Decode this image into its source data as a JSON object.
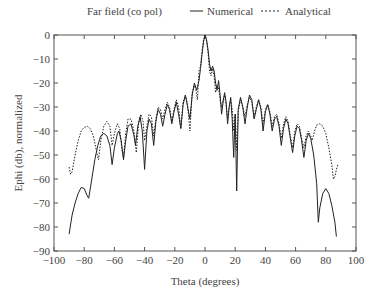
{
  "chart_data": {
    "type": "line",
    "title": "Far field (co pol)",
    "xlabel": "Theta (degrees)",
    "ylabel": "Ephi (db), normalized",
    "xlim": [
      -100,
      100
    ],
    "ylim": [
      -90,
      0
    ],
    "xticks": [
      -100,
      -80,
      -60,
      -40,
      -20,
      0,
      20,
      40,
      60,
      80,
      100
    ],
    "yticks": [
      0,
      -10,
      -20,
      -30,
      -40,
      -50,
      -60,
      -70,
      -80,
      -90
    ],
    "grid": false,
    "legend_position": "top",
    "series": [
      {
        "name": "Numerical",
        "style": "solid",
        "points": [
          [
            -90,
            -83
          ],
          [
            -88,
            -75
          ],
          [
            -86,
            -70
          ],
          [
            -84,
            -66
          ],
          [
            -82,
            -63.5
          ],
          [
            -80,
            -64
          ],
          [
            -78,
            -67
          ],
          [
            -77,
            -68
          ],
          [
            -75,
            -60
          ],
          [
            -73,
            -52
          ],
          [
            -71,
            -46
          ],
          [
            -69,
            -42
          ],
          [
            -67,
            -41
          ],
          [
            -65,
            -42
          ],
          [
            -63,
            -46
          ],
          [
            -61.5,
            -54
          ],
          [
            -60,
            -47
          ],
          [
            -58,
            -41
          ],
          [
            -57,
            -40
          ],
          [
            -55.5,
            -44
          ],
          [
            -54,
            -52
          ],
          [
            -52.5,
            -44
          ],
          [
            -51,
            -38
          ],
          [
            -49,
            -37
          ],
          [
            -47,
            -42
          ],
          [
            -46,
            -46
          ],
          [
            -44.5,
            -38
          ],
          [
            -43,
            -34
          ],
          [
            -41.5,
            -40
          ],
          [
            -40,
            -56
          ],
          [
            -38.5,
            -40
          ],
          [
            -37,
            -35
          ],
          [
            -35.5,
            -37
          ],
          [
            -34,
            -46
          ],
          [
            -32.5,
            -36
          ],
          [
            -31,
            -31
          ],
          [
            -29.5,
            -33
          ],
          [
            -28,
            -38
          ],
          [
            -26.5,
            -33
          ],
          [
            -25,
            -29
          ],
          [
            -23.5,
            -31
          ],
          [
            -22,
            -37
          ],
          [
            -20.5,
            -32
          ],
          [
            -19,
            -28
          ],
          [
            -17.5,
            -33
          ],
          [
            -16,
            -39
          ],
          [
            -14.5,
            -29
          ],
          [
            -13,
            -25
          ],
          [
            -11.5,
            -30
          ],
          [
            -10,
            -35
          ],
          [
            -8.5,
            -25
          ],
          [
            -7,
            -20
          ],
          [
            -5.5,
            -23
          ],
          [
            -4,
            -19
          ],
          [
            -3,
            -14
          ],
          [
            -2,
            -8
          ],
          [
            -1,
            -3
          ],
          [
            0,
            0
          ],
          [
            1,
            -2
          ],
          [
            2,
            -6
          ],
          [
            3,
            -12
          ],
          [
            4,
            -15
          ],
          [
            5,
            -13
          ],
          [
            6,
            -15
          ],
          [
            7,
            -20
          ],
          [
            8,
            -23
          ],
          [
            9,
            -19
          ],
          [
            10,
            -25
          ],
          [
            11,
            -33
          ],
          [
            12,
            -28
          ],
          [
            13,
            -24
          ],
          [
            14,
            -28
          ],
          [
            15,
            -37
          ],
          [
            16,
            -30
          ],
          [
            17,
            -26
          ],
          [
            18,
            -35
          ],
          [
            19,
            -51
          ],
          [
            20,
            -33
          ],
          [
            21,
            -65
          ],
          [
            22,
            -31
          ],
          [
            23.5,
            -26
          ],
          [
            25,
            -30
          ],
          [
            26.5,
            -37
          ],
          [
            28,
            -30
          ],
          [
            29.5,
            -25
          ],
          [
            31,
            -27
          ],
          [
            32.5,
            -35
          ],
          [
            34,
            -31
          ],
          [
            35.5,
            -27
          ],
          [
            37,
            -31
          ],
          [
            38.5,
            -40
          ],
          [
            40,
            -32
          ],
          [
            41.5,
            -29
          ],
          [
            43,
            -33
          ],
          [
            44.5,
            -40
          ],
          [
            46,
            -35
          ],
          [
            47.5,
            -34
          ],
          [
            49,
            -38
          ],
          [
            50.5,
            -46
          ],
          [
            52,
            -39
          ],
          [
            53.5,
            -35
          ],
          [
            55,
            -37
          ],
          [
            56.5,
            -43
          ],
          [
            58,
            -49
          ],
          [
            59.5,
            -42
          ],
          [
            61,
            -38
          ],
          [
            62.5,
            -39
          ],
          [
            64,
            -44
          ],
          [
            65.5,
            -51
          ],
          [
            67,
            -44
          ],
          [
            68.5,
            -41
          ],
          [
            70,
            -43
          ],
          [
            72,
            -50
          ],
          [
            74,
            -62
          ],
          [
            75,
            -78
          ],
          [
            76,
            -72
          ],
          [
            78,
            -66
          ],
          [
            80,
            -64
          ],
          [
            82,
            -66
          ],
          [
            84,
            -71
          ],
          [
            86,
            -78
          ],
          [
            87,
            -84
          ]
        ]
      },
      {
        "name": "Analytical",
        "style": "dashed",
        "points": [
          [
            -90,
            -55
          ],
          [
            -89,
            -58
          ],
          [
            -88,
            -57
          ],
          [
            -86,
            -50
          ],
          [
            -84,
            -44
          ],
          [
            -82,
            -40
          ],
          [
            -80,
            -38.5
          ],
          [
            -78,
            -38
          ],
          [
            -76,
            -39
          ],
          [
            -74,
            -42
          ],
          [
            -72,
            -48
          ],
          [
            -70.5,
            -52
          ],
          [
            -69,
            -44
          ],
          [
            -67,
            -38
          ],
          [
            -65,
            -36
          ],
          [
            -63,
            -38
          ],
          [
            -61.5,
            -46
          ],
          [
            -60,
            -41
          ],
          [
            -58,
            -37
          ],
          [
            -56.5,
            -39
          ],
          [
            -55,
            -48
          ],
          [
            -54,
            -51
          ],
          [
            -52.5,
            -41
          ],
          [
            -51,
            -35
          ],
          [
            -49,
            -35
          ],
          [
            -47,
            -40
          ],
          [
            -45.5,
            -49
          ],
          [
            -44,
            -37
          ],
          [
            -42.5,
            -33
          ],
          [
            -41,
            -36
          ],
          [
            -40,
            -44
          ],
          [
            -38.5,
            -38
          ],
          [
            -37,
            -33
          ],
          [
            -35.5,
            -34
          ],
          [
            -34,
            -42
          ],
          [
            -32.5,
            -35
          ],
          [
            -31,
            -30
          ],
          [
            -29.5,
            -31
          ],
          [
            -28,
            -35
          ],
          [
            -26.5,
            -31
          ],
          [
            -25,
            -28
          ],
          [
            -23.5,
            -30
          ],
          [
            -22,
            -36
          ],
          [
            -20.5,
            -31
          ],
          [
            -19,
            -27
          ],
          [
            -17.5,
            -30
          ],
          [
            -16,
            -39
          ],
          [
            -14.5,
            -28
          ],
          [
            -13,
            -25
          ],
          [
            -11.5,
            -29
          ],
          [
            -10,
            -40
          ],
          [
            -8.5,
            -24
          ],
          [
            -7,
            -21
          ],
          [
            -6,
            -23
          ],
          [
            -5,
            -27
          ],
          [
            -4,
            -15
          ],
          [
            -3,
            -13
          ],
          [
            -2,
            -7
          ],
          [
            -1,
            -2
          ],
          [
            0,
            0
          ],
          [
            1,
            -2
          ],
          [
            2,
            -7
          ],
          [
            3,
            -15
          ],
          [
            4,
            -17
          ],
          [
            5,
            -14
          ],
          [
            6,
            -17
          ],
          [
            7,
            -24
          ],
          [
            8,
            -21
          ],
          [
            9,
            -22
          ],
          [
            10,
            -27
          ],
          [
            11,
            -30
          ],
          [
            12,
            -27
          ],
          [
            13,
            -25
          ],
          [
            14,
            -29
          ],
          [
            15,
            -35
          ],
          [
            16,
            -30
          ],
          [
            17,
            -27
          ],
          [
            18,
            -31
          ],
          [
            19,
            -40
          ],
          [
            20,
            -33
          ],
          [
            21,
            -48
          ],
          [
            22,
            -32
          ],
          [
            23.5,
            -27
          ],
          [
            25,
            -30
          ],
          [
            26.5,
            -34
          ],
          [
            28,
            -29
          ],
          [
            29.5,
            -26
          ],
          [
            31,
            -28
          ],
          [
            32.5,
            -34
          ],
          [
            34,
            -30
          ],
          [
            35.5,
            -27
          ],
          [
            37,
            -30
          ],
          [
            38.5,
            -37
          ],
          [
            40,
            -31
          ],
          [
            41.5,
            -29
          ],
          [
            43,
            -32
          ],
          [
            44.5,
            -38
          ],
          [
            46,
            -34
          ],
          [
            47.5,
            -33
          ],
          [
            49,
            -37
          ],
          [
            50.5,
            -43
          ],
          [
            52,
            -37
          ],
          [
            53.5,
            -34
          ],
          [
            55,
            -36
          ],
          [
            56.5,
            -42
          ],
          [
            58,
            -47
          ],
          [
            59.5,
            -40
          ],
          [
            61,
            -37
          ],
          [
            62.5,
            -38
          ],
          [
            64,
            -43
          ],
          [
            65.5,
            -47
          ],
          [
            67,
            -42
          ],
          [
            68.5,
            -40
          ],
          [
            70,
            -42
          ],
          [
            71,
            -44
          ],
          [
            72.5,
            -40
          ],
          [
            74,
            -37.5
          ],
          [
            76,
            -37
          ],
          [
            78,
            -38
          ],
          [
            80,
            -41
          ],
          [
            82,
            -47
          ],
          [
            84,
            -54
          ],
          [
            85,
            -60
          ],
          [
            86,
            -59
          ],
          [
            87,
            -56
          ],
          [
            88,
            -54
          ]
        ]
      }
    ]
  },
  "legend": {
    "title": "Far field (co pol)",
    "entries": [
      {
        "label": "Numerical",
        "style": "solid"
      },
      {
        "label": "Analytical",
        "style": "dashed"
      }
    ]
  },
  "axes": {
    "xlabel": "Theta (degrees)",
    "ylabel": "Ephi (db), normalized",
    "xtick_labels": [
      "−100",
      "−80",
      "−60",
      "−40",
      "−20",
      "0",
      "20",
      "40",
      "60",
      "80",
      "100"
    ],
    "ytick_labels": [
      "0",
      "−10",
      "−20",
      "−30",
      "−40",
      "−50",
      "−60",
      "−70",
      "−80",
      "−90"
    ]
  },
  "colors": {
    "line": "#222222",
    "frame": "#555555",
    "text": "#444444"
  }
}
